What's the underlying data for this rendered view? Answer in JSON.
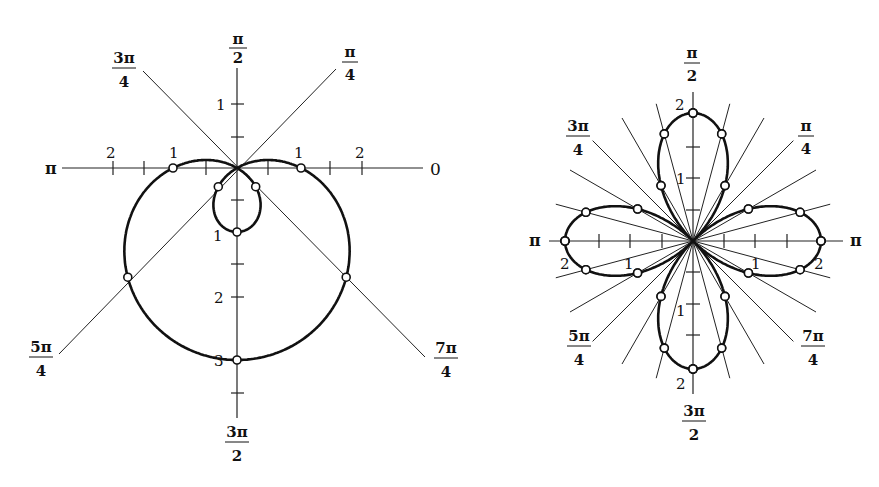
{
  "figures": [
    {
      "id": "limacon",
      "equation": "r = 1 - 2 sin θ",
      "origin": [
        237,
        168
      ],
      "unit_px": 64,
      "axis_labels": {
        "zero": "0",
        "pi": "π",
        "pi_over_2": {
          "num": "π",
          "den": "2"
        },
        "three_pi_over_2": {
          "num": "3π",
          "den": "2"
        },
        "pi_over_4": {
          "num": "π",
          "den": "4"
        },
        "three_pi_over_4": {
          "num": "3π",
          "den": "4"
        },
        "five_pi_over_4": {
          "num": "5π",
          "den": "4"
        },
        "seven_pi_over_4": {
          "num": "7π",
          "den": "4"
        }
      },
      "tick_labels": {
        "horizontal_left": [
          "2",
          "1"
        ],
        "horizontal_right": [
          "1",
          "2"
        ],
        "vertical_up": [
          "1"
        ],
        "vertical_down": [
          "1",
          "2",
          "3"
        ]
      },
      "marked_points_r": [
        {
          "theta_deg": 0,
          "r": 1
        },
        {
          "theta_deg": 180,
          "r": 1
        },
        {
          "theta_deg": 45,
          "r": -0.414
        },
        {
          "theta_deg": 135,
          "r": -0.414
        },
        {
          "theta_deg": 90,
          "r": -1
        },
        {
          "theta_deg": 225,
          "r": 2.414
        },
        {
          "theta_deg": 315,
          "r": 2.414
        },
        {
          "theta_deg": 270,
          "r": 3
        }
      ]
    },
    {
      "id": "four-leaved-rose",
      "equation": "r = 2 cos 2θ",
      "origin": [
        693,
        241
      ],
      "unit_px": 64,
      "axis_labels": {
        "right": "π",
        "left": "π",
        "pi_over_2": {
          "num": "π",
          "den": "2"
        },
        "three_pi_over_2": {
          "num": "3π",
          "den": "2"
        },
        "pi_over_4": {
          "num": "π",
          "den": "4"
        },
        "three_pi_over_4": {
          "num": "3π",
          "den": "4"
        },
        "five_pi_over_4": {
          "num": "5π",
          "den": "4"
        },
        "seven_pi_over_4": {
          "num": "7π",
          "den": "4"
        }
      },
      "tick_labels": {
        "horizontal_left": [
          "2",
          "1"
        ],
        "horizontal_right": [
          "1",
          "2"
        ],
        "vertical_up": [
          "2",
          "1"
        ],
        "vertical_down": [
          "1",
          "2"
        ]
      },
      "ray_step_deg": 15,
      "marked_points_r": [
        {
          "theta_deg": 0,
          "r": 2
        },
        {
          "theta_deg": 15,
          "r": 1.732
        },
        {
          "theta_deg": 30,
          "r": 1
        },
        {
          "theta_deg": 60,
          "r": 1
        },
        {
          "theta_deg": 75,
          "r": 1.732
        },
        {
          "theta_deg": 90,
          "r": 2
        }
      ]
    }
  ]
}
